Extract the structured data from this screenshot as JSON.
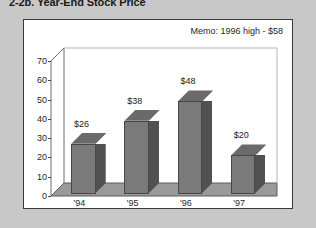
{
  "page": {
    "title": "2-2b. Year-End Stock Price",
    "background_color": "#c8c8c8",
    "panel_background": "#ffffff",
    "panel_border_color": "#3a3a3a"
  },
  "memo": {
    "text": "Memo: 1996 high - $58"
  },
  "chart_data": {
    "type": "bar",
    "title": "2-2b. Year-End Stock Price",
    "subtitle": "",
    "xlabel": "",
    "ylabel": "",
    "categories": [
      "'94",
      "'95",
      "'96",
      "'97"
    ],
    "values": [
      26,
      38,
      48,
      20
    ],
    "data_labels": [
      "$26",
      "$38",
      "$48",
      "$20"
    ],
    "ylim": [
      0,
      70
    ],
    "ytick_values": [
      0,
      10,
      20,
      30,
      40,
      50,
      60,
      70
    ],
    "ytick_labels": [
      "0",
      "10",
      "20",
      "30",
      "40",
      "50",
      "60",
      "70"
    ],
    "grid": false,
    "legend": false,
    "legend_position": "none",
    "style": "3d-column",
    "bar_face_color": "#7a7a7a",
    "bar_side_color": "#515151",
    "bar_top_color": "#6a6a6a",
    "annotations": [
      "Memo: 1996 high - $58"
    ]
  }
}
